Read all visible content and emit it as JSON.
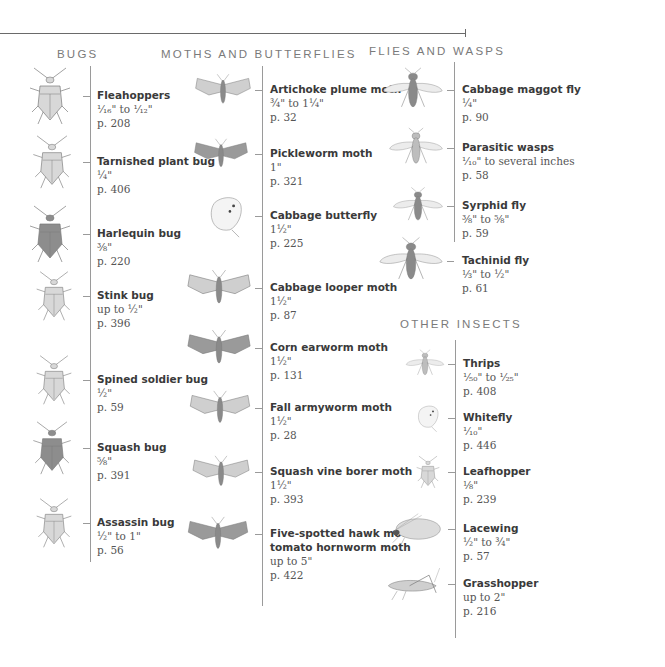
{
  "headings": {
    "bugs": "BUGS",
    "moths": "MOTHS AND BUTTERFLIES",
    "flies": "FLIES AND WASPS",
    "other": "OTHER INSECTS"
  },
  "bugs": [
    {
      "name": "Fleahoppers",
      "size": "¹⁄₁₆\" to ¹⁄₁₂\"",
      "page": "p. 208",
      "icon": "fleahopper-icon"
    },
    {
      "name": "Tarnished plant bug",
      "size": "¼\"",
      "page": "p. 406",
      "icon": "tarnished-plant-bug-icon"
    },
    {
      "name": "Harlequin bug",
      "size": "⅜\"",
      "page": "p. 220",
      "icon": "harlequin-bug-icon"
    },
    {
      "name": "Stink bug",
      "size": "up to ½\"",
      "page": "p. 396",
      "icon": "stink-bug-icon"
    },
    {
      "name": "Spined soldier bug",
      "size": "½\"",
      "page": "p. 59",
      "icon": "spined-soldier-bug-icon"
    },
    {
      "name": "Squash bug",
      "size": "⅝\"",
      "page": "p. 391",
      "icon": "squash-bug-icon"
    },
    {
      "name": "Assassin bug",
      "size": "½\" to 1\"",
      "page": "p. 56",
      "icon": "assassin-bug-icon"
    }
  ],
  "moths": [
    {
      "name": "Artichoke plume moth",
      "size": "¾\" to 1¼\"",
      "page": "p. 32",
      "icon": "artichoke-plume-moth-icon"
    },
    {
      "name": "Pickleworm moth",
      "size": "1\"",
      "page": "p. 321",
      "icon": "pickleworm-moth-icon"
    },
    {
      "name": "Cabbage butterfly",
      "size": "1½\"",
      "page": "p. 225",
      "icon": "cabbage-butterfly-icon"
    },
    {
      "name": "Cabbage looper moth",
      "size": "1½\"",
      "page": "p. 87",
      "icon": "cabbage-looper-moth-icon"
    },
    {
      "name": "Corn earworm moth",
      "size": "1½\"",
      "page": "p. 131",
      "icon": "corn-earworm-moth-icon"
    },
    {
      "name": "Fall armyworm moth",
      "size": "1½\"",
      "page": "p. 28",
      "icon": "fall-armyworm-moth-icon"
    },
    {
      "name": "Squash vine borer moth",
      "size": "1½\"",
      "page": "p. 393",
      "icon": "squash-vine-borer-moth-icon"
    },
    {
      "name": "Five-spotted hawk moth/",
      "name2": "tomato hornworm moth",
      "size": "up to 5\"",
      "page": "p. 422",
      "icon": "hawk-moth-icon"
    }
  ],
  "flies": [
    {
      "name": "Cabbage maggot fly",
      "size": "¼\"",
      "page": "p. 90",
      "icon": "cabbage-maggot-fly-icon"
    },
    {
      "name": "Parasitic wasps",
      "size": "¹⁄₁₀\" to several inches",
      "page": "p. 58",
      "icon": "parasitic-wasp-icon"
    },
    {
      "name": "Syrphid fly",
      "size": "⅜\" to ⅝\"",
      "page": "p. 59",
      "icon": "syrphid-fly-icon"
    },
    {
      "name": "Tachinid fly",
      "size": "⅓\" to ½\"",
      "page": "p. 61",
      "icon": "tachinid-fly-icon"
    }
  ],
  "other": [
    {
      "name": "Thrips",
      "size": "¹⁄₅₀\" to ¹⁄₂₅\"",
      "page": "p. 408",
      "icon": "thrips-icon"
    },
    {
      "name": "Whitefly",
      "size": "¹⁄₁₀\"",
      "page": "p. 446",
      "icon": "whitefly-icon"
    },
    {
      "name": "Leafhopper",
      "size": "⅛\"",
      "page": "p. 239",
      "icon": "leafhopper-icon"
    },
    {
      "name": "Lacewing",
      "size": "½\" to ¾\"",
      "page": "p. 57",
      "icon": "lacewing-icon"
    },
    {
      "name": "Grasshopper",
      "size": "up to 2\"",
      "page": "p. 216",
      "icon": "grasshopper-icon"
    }
  ]
}
